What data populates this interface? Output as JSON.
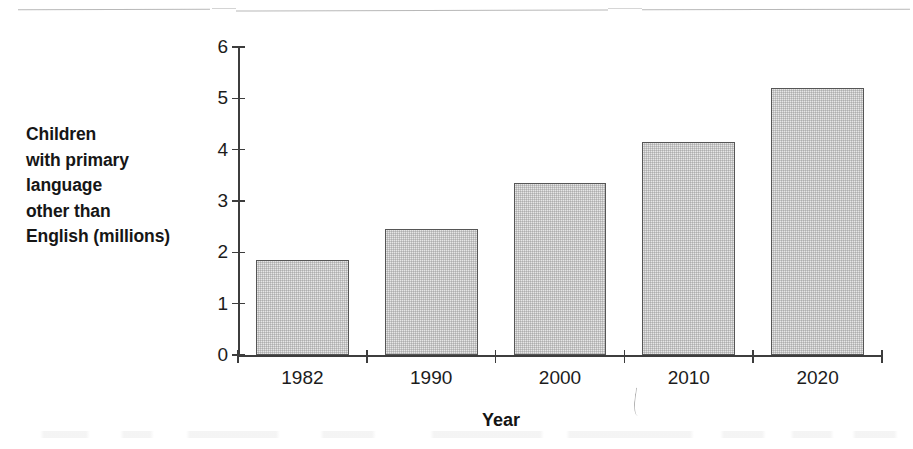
{
  "chart_data": {
    "type": "bar",
    "title": "",
    "subtitle": "",
    "categories": [
      "1982",
      "1990",
      "2000",
      "2010",
      "2020"
    ],
    "values": [
      1.85,
      2.45,
      3.35,
      4.15,
      5.2
    ],
    "series": [
      {
        "name": "Children with primary language other than English (millions)",
        "values": [
          1.85,
          2.45,
          3.35,
          4.15,
          5.2
        ]
      }
    ],
    "xlabel": "Year",
    "ylabel": "Children with primary language other than English (millions)",
    "ylabel_lines": [
      "Children",
      "with primary",
      "language",
      "other than",
      "English (millions)"
    ],
    "ylim": [
      0,
      6
    ],
    "ytick_labels": [
      "0",
      "1",
      "2",
      "3",
      "4",
      "5",
      "6"
    ],
    "ytick_values": [
      0,
      1,
      2,
      3,
      4,
      5,
      6
    ],
    "grid": false,
    "legend": false,
    "legend_position": "none",
    "bar_fill_color": "#e6e6e6",
    "bar_border_color": "#565656",
    "axis_color": "#3d3d3d",
    "text_color": "#1a1a1a",
    "background_color": "#ffffff",
    "annotations": []
  },
  "axis": {
    "x_title": "Year"
  }
}
